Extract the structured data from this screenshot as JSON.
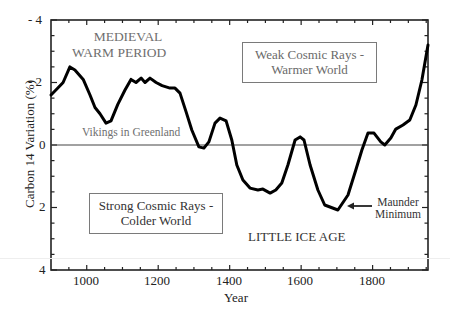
{
  "chart_data": {
    "type": "line",
    "title": "",
    "xlabel": "Year",
    "ylabel": "Carbon 14 Variation (%)",
    "xlim": [
      900,
      1955
    ],
    "ylim": [
      4,
      -4
    ],
    "y_inverted": true,
    "grid": false,
    "legend": null,
    "x_ticks": [
      1000,
      1200,
      1400,
      1600,
      1800
    ],
    "x_tick_labels": [
      "1000",
      "1200",
      "1400",
      "1600",
      "1800"
    ],
    "y_ticks": [
      -4,
      -2,
      0,
      2,
      4
    ],
    "y_tick_labels": [
      "- 4",
      "- 2",
      "0",
      "2",
      "4"
    ],
    "reference_line": {
      "y": 0
    },
    "series": [
      {
        "name": "Carbon 14 Variation",
        "x": [
          900,
          917,
          934,
          953,
          967,
          990,
          1009,
          1023,
          1037,
          1054,
          1068,
          1087,
          1107,
          1124,
          1138,
          1152,
          1163,
          1177,
          1194,
          1211,
          1233,
          1247,
          1261,
          1278,
          1294,
          1314,
          1328,
          1342,
          1359,
          1373,
          1390,
          1406,
          1420,
          1437,
          1457,
          1479,
          1493,
          1513,
          1529,
          1546,
          1563,
          1583,
          1597,
          1608,
          1625,
          1647,
          1666,
          1703,
          1731,
          1753,
          1770,
          1787,
          1804,
          1823,
          1834,
          1851,
          1865,
          1885,
          1904,
          1921,
          1938,
          1955
        ],
        "values": [
          -1.6,
          -1.8,
          -2.0,
          -2.5,
          -2.4,
          -2.1,
          -1.6,
          -1.2,
          -1.0,
          -0.7,
          -0.77,
          -1.3,
          -1.76,
          -2.1,
          -2.0,
          -2.14,
          -2.0,
          -2.14,
          -2.0,
          -1.9,
          -1.82,
          -1.82,
          -1.66,
          -1.06,
          -0.48,
          0.06,
          0.1,
          -0.1,
          -0.7,
          -0.86,
          -0.77,
          -0.16,
          0.64,
          1.12,
          1.38,
          1.44,
          1.41,
          1.54,
          1.44,
          1.22,
          0.64,
          -0.16,
          -0.26,
          -0.16,
          0.64,
          1.44,
          1.92,
          2.08,
          1.6,
          0.8,
          0.16,
          -0.38,
          -0.38,
          -0.1,
          0.0,
          -0.22,
          -0.51,
          -0.64,
          -0.8,
          -1.28,
          -2.08,
          -3.2
        ]
      }
    ],
    "annotations": [
      {
        "text": "MEDIEVAL WARM PERIOD",
        "x": 1025,
        "y": -3.3
      },
      {
        "text": "Vikings in Greenland",
        "x": 1100,
        "y": -0.3
      },
      {
        "text": "Weak Cosmic Rays - Warmer World",
        "x": 1590,
        "y": -3.1,
        "boxed": true
      },
      {
        "text": "Strong Cosmic Rays - Colder World",
        "x": 1150,
        "y": 2.05,
        "boxed": true
      },
      {
        "text": "LITTLE ICE AGE",
        "x": 1650,
        "y": 2.9
      },
      {
        "text": "Maunder Minimum",
        "x": 1830,
        "y": 1.95,
        "arrow_to": [
          1710,
          1.95
        ]
      }
    ]
  },
  "labels": {
    "ylabel": "Carbon 14 Variation (%)",
    "xlabel": "Year",
    "medieval_line1": "MEDIEVAL",
    "medieval_line2": "WARM PERIOD",
    "vikings": "Vikings in Greenland",
    "weak_line1": "Weak Cosmic Rays -",
    "weak_line2": "Warmer World",
    "strong_line1": "Strong Cosmic Rays -",
    "strong_line2": "Colder World",
    "little_ice_age": "LITTLE ICE AGE",
    "maunder_line1": "Maunder",
    "maunder_line2": "Minimum"
  },
  "ticks": {
    "y": [
      "- 4",
      "- 2",
      "0",
      "2",
      "4"
    ],
    "x": [
      "1000",
      "1200",
      "1400",
      "1600",
      "1800"
    ]
  },
  "colors": {
    "line": "#000000",
    "annotation_text": "#6f6f6f",
    "axis": "#222222"
  }
}
